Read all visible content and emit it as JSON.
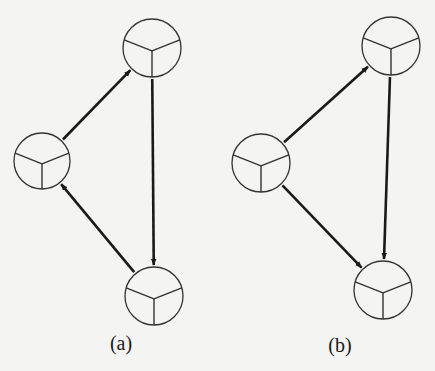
{
  "colors": {
    "background": "#f4f4f2",
    "stroke": "#1a1a1a",
    "node_stroke": "#333333"
  },
  "diagrams": [
    {
      "id": "a",
      "label": "(a)",
      "label_pos": [
        121,
        344
      ],
      "nodes": [
        {
          "id": "a-left",
          "cx": 42,
          "cy": 161,
          "r": 28,
          "icon": "trisected-circle"
        },
        {
          "id": "a-top",
          "cx": 152,
          "cy": 48,
          "r": 29,
          "icon": "trisected-circle"
        },
        {
          "id": "a-bottom",
          "cx": 154,
          "cy": 296,
          "r": 29,
          "icon": "trisected-circle"
        }
      ],
      "edges": [
        {
          "from": "a-left",
          "to": "a-top",
          "directed": true
        },
        {
          "from": "a-top",
          "to": "a-bottom",
          "directed": true
        },
        {
          "from": "a-bottom",
          "to": "a-left",
          "directed": true
        }
      ]
    },
    {
      "id": "b",
      "label": "(b)",
      "label_pos": [
        340,
        346
      ],
      "nodes": [
        {
          "id": "b-left",
          "cx": 261,
          "cy": 163,
          "r": 29,
          "icon": "trisected-circle"
        },
        {
          "id": "b-top",
          "cx": 391,
          "cy": 46,
          "r": 29,
          "icon": "trisected-circle"
        },
        {
          "id": "b-bottom",
          "cx": 383,
          "cy": 290,
          "r": 29,
          "icon": "trisected-circle"
        }
      ],
      "edges": [
        {
          "from": "b-left",
          "to": "b-top",
          "directed": true
        },
        {
          "from": "b-top",
          "to": "b-bottom",
          "directed": true
        },
        {
          "from": "b-left",
          "to": "b-bottom",
          "directed": true
        }
      ]
    }
  ]
}
